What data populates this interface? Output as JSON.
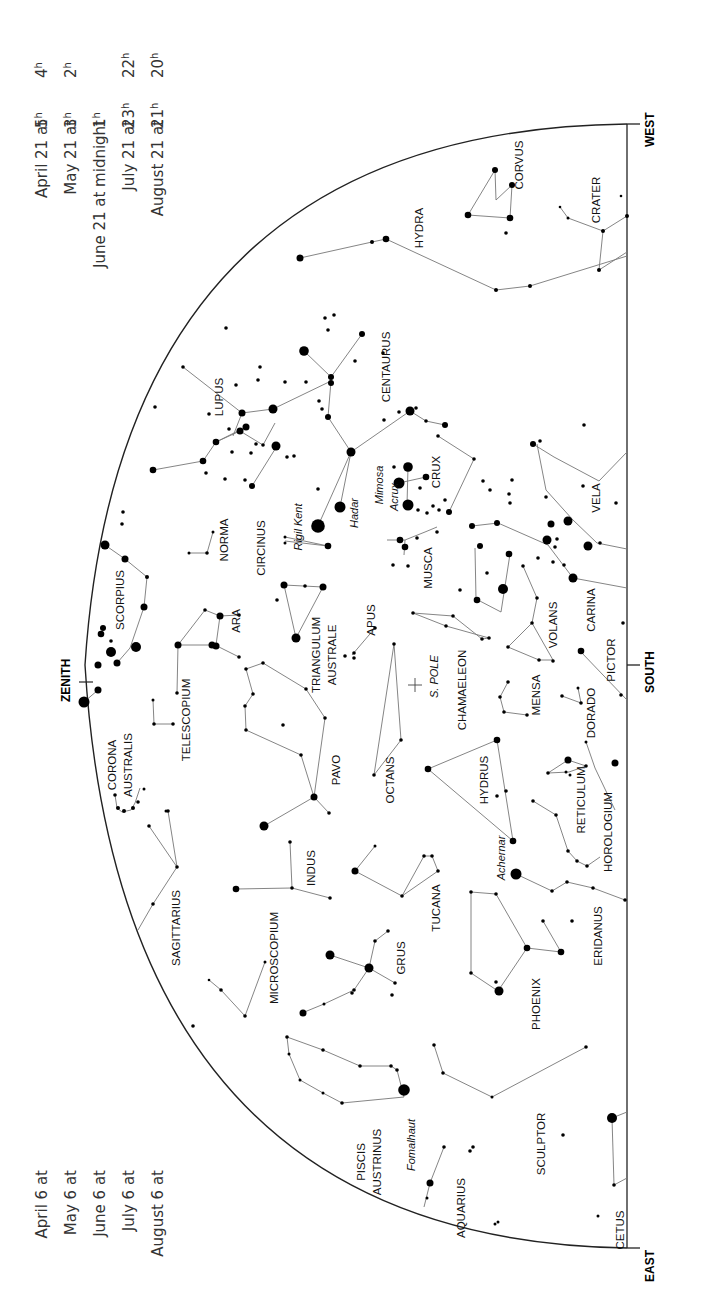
{
  "map": {
    "title": "Southern sky star chart",
    "directions": {
      "west": "WEST",
      "south": "SOUTH",
      "east": "EAST",
      "zenith": "ZENITH",
      "pole": "S. POLE"
    },
    "times_top": [
      {
        "date": "April 21 at",
        "time": "4",
        "sup": "h"
      },
      {
        "date": "May 21 at",
        "time": "2",
        "sup": "h"
      },
      {
        "date": "June 21 at midnight",
        "time": "",
        "sup": ""
      },
      {
        "date": "July 21 at",
        "time": "22",
        "sup": "h"
      },
      {
        "date": "August 21 at",
        "time": "20",
        "sup": "h"
      }
    ],
    "times_bottom": [
      {
        "date": "April 6 at",
        "time": "5",
        "sup": "h"
      },
      {
        "date": "May 6 at",
        "time": "3",
        "sup": "h"
      },
      {
        "date": "June 6 at",
        "time": "1",
        "sup": "h"
      },
      {
        "date": "July 6 at",
        "time": "23",
        "sup": "h"
      },
      {
        "date": "August 6 at",
        "time": "21",
        "sup": "h"
      }
    ],
    "constellations": [
      {
        "name": "CORVUS",
        "x": 523,
        "y": 165
      },
      {
        "name": "CRATER",
        "x": 600,
        "y": 200
      },
      {
        "name": "HYDRA",
        "x": 423,
        "y": 228
      },
      {
        "name": "CENTAURUS",
        "x": 390,
        "y": 367
      },
      {
        "name": "LUPUS",
        "x": 223,
        "y": 397
      },
      {
        "name": "CRUX",
        "x": 440,
        "y": 472
      },
      {
        "name": "VELA",
        "x": 600,
        "y": 498
      },
      {
        "name": "NORMA",
        "x": 228,
        "y": 540
      },
      {
        "name": "CIRCINUS",
        "x": 265,
        "y": 548
      },
      {
        "name": "MUSCA",
        "x": 432,
        "y": 568
      },
      {
        "name": "SCORPIUS",
        "x": 124,
        "y": 600
      },
      {
        "name": "CARINA",
        "x": 595,
        "y": 610
      },
      {
        "name": "VOLANS",
        "x": 557,
        "y": 625
      },
      {
        "name": "ARA",
        "x": 240,
        "y": 621
      },
      {
        "name": "APUS",
        "x": 375,
        "y": 620
      },
      {
        "name": "PICTOR",
        "x": 615,
        "y": 660
      },
      {
        "name": "TRIANGULUM",
        "x": 320,
        "y": 655
      },
      {
        "name": "AUSTRALE",
        "x": 336,
        "y": 655
      },
      {
        "name": "CHAMAELEON",
        "x": 466,
        "y": 690
      },
      {
        "name": "MENSA",
        "x": 540,
        "y": 695
      },
      {
        "name": "DORADO",
        "x": 595,
        "y": 713
      },
      {
        "name": "TELESCOPIUM",
        "x": 190,
        "y": 720
      },
      {
        "name": "CORONA",
        "x": 116,
        "y": 765
      },
      {
        "name": "AUSTRALIS",
        "x": 132,
        "y": 765
      },
      {
        "name": "PAVO",
        "x": 340,
        "y": 770
      },
      {
        "name": "OCTANS",
        "x": 394,
        "y": 780
      },
      {
        "name": "HYDRUS",
        "x": 488,
        "y": 780
      },
      {
        "name": "RETICULUM",
        "x": 585,
        "y": 800
      },
      {
        "name": "HOROLOGIUM",
        "x": 612,
        "y": 832
      },
      {
        "name": "INDUS",
        "x": 315,
        "y": 868
      },
      {
        "name": "TUCANA",
        "x": 440,
        "y": 908
      },
      {
        "name": "SAGITTARIUS",
        "x": 180,
        "y": 928
      },
      {
        "name": "ERIDANUS",
        "x": 602,
        "y": 936
      },
      {
        "name": "MICROSCOPIUM",
        "x": 278,
        "y": 958
      },
      {
        "name": "GRUS",
        "x": 405,
        "y": 958
      },
      {
        "name": "PHOENIX",
        "x": 540,
        "y": 1004
      },
      {
        "name": "SCULPTOR",
        "x": 545,
        "y": 1144
      },
      {
        "name": "PISCIS",
        "x": 365,
        "y": 1162
      },
      {
        "name": "AUSTRINUS",
        "x": 381,
        "y": 1162
      },
      {
        "name": "AQUARIUS",
        "x": 465,
        "y": 1208
      },
      {
        "name": "CETUS",
        "x": 624,
        "y": 1230
      }
    ],
    "named_stars": [
      {
        "name": "Rigil Kent",
        "x": 302,
        "y": 527
      },
      {
        "name": "Hadar",
        "x": 358,
        "y": 513
      },
      {
        "name": "Mimosa",
        "x": 383,
        "y": 485
      },
      {
        "name": "Acrux",
        "x": 398,
        "y": 497
      },
      {
        "name": "Achernar",
        "x": 505,
        "y": 858
      },
      {
        "name": "Fomalhaut",
        "x": 415,
        "y": 1145
      }
    ]
  }
}
